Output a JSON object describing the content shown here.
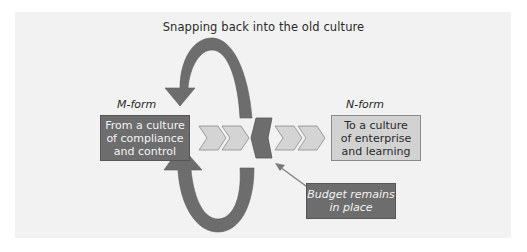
{
  "title": "Snapping back into the old culture",
  "left": {
    "label": "M-form",
    "box_text": "From a culture\nof compliance\nand control"
  },
  "right": {
    "label": "N-form",
    "box_text": "To a culture\nof enterprise\nand learning"
  },
  "callout": {
    "text": "Budget remains\nin place"
  },
  "colors": {
    "panel_bg": "#f2f2f2",
    "dark_fill": "#6d6d6d",
    "light_fill": "#d2d2d2",
    "arrow_fill": "#6d6d6d",
    "chevron_fill": "#d4d4d4"
  },
  "elements": {
    "top_arrow": "curved-arrow-snapping-back",
    "bottom_arrow": "curved-arrow-return",
    "chevrons_left": 2,
    "chevrons_right": 2,
    "barrier": "budget-barrier"
  }
}
